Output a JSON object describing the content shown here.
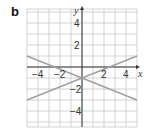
{
  "panel_label": "b",
  "chart_data": {
    "type": "line",
    "title": "",
    "xlabel": "x",
    "ylabel": "y",
    "xlim": [
      -5,
      5
    ],
    "ylim": [
      -5.5,
      5.3
    ],
    "grid": true,
    "x_ticks": [
      "-4",
      "-2",
      "2",
      "4"
    ],
    "y_ticks": [
      "4",
      "2",
      "-2",
      "-4"
    ],
    "series": [
      {
        "name": "line_decreasing",
        "equation": "y = -0.4x - 1",
        "x": [
          -5,
          5
        ],
        "y": [
          1,
          -3
        ]
      },
      {
        "name": "line_increasing",
        "equation": "y = 0.4x - 1",
        "x": [
          -5,
          5
        ],
        "y": [
          -3,
          1
        ]
      }
    ],
    "intersection": [
      0,
      -1
    ],
    "colors": {
      "grid": "#c8c8c8",
      "axes": "#333333",
      "lines": "#a0a0a0"
    }
  }
}
